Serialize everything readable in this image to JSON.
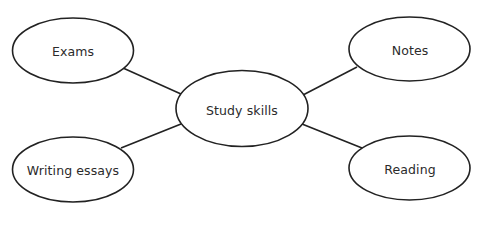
{
  "diagram": {
    "type": "mind-map",
    "stroke_color": "#222222",
    "center": {
      "id": "study-skills",
      "label": "Study skills"
    },
    "branches": [
      {
        "id": "exams",
        "label": "Exams"
      },
      {
        "id": "notes",
        "label": "Notes"
      },
      {
        "id": "writing-essays",
        "label": "Writing essays"
      },
      {
        "id": "reading",
        "label": "Reading"
      }
    ]
  }
}
